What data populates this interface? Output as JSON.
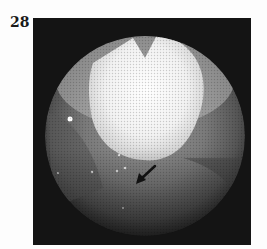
{
  "figure": {
    "label": "28",
    "image": {
      "kind": "endoscopic-photograph",
      "description": "Circular endoscopic field of view with a bright white mass at top center; a black arrow in the lower center points down-left toward a lesion.",
      "annotations": [
        {
          "type": "arrow",
          "direction": "down-left",
          "color": "#111111"
        }
      ],
      "colors": {
        "frame_background": "#141414",
        "field_mid": "#6e6e6e",
        "highlight": "#f4f4f4"
      }
    }
  }
}
